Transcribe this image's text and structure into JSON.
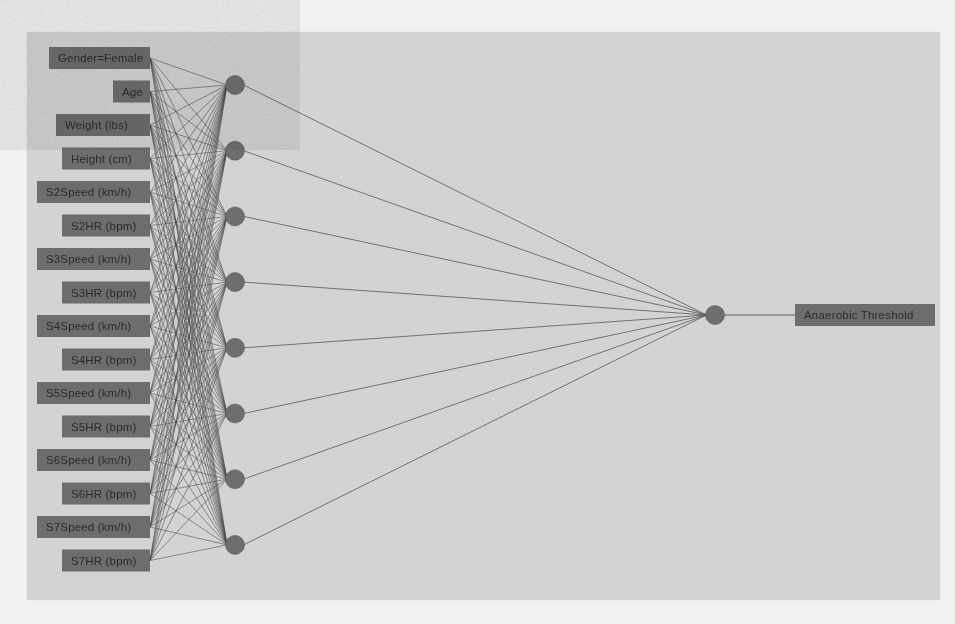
{
  "diagram": {
    "type": "multilayer-perceptron",
    "colors": {
      "outer_background": "#f1f1f1",
      "panel_background": "#d3d3d3",
      "node_fill": "#6e6e6e",
      "label_box_fill": "#6d6d6d",
      "label_text": "#2a2a2a",
      "edge": "#4a4a4a"
    },
    "layers": {
      "input": {
        "name": "input-layer",
        "count": 16,
        "nodes": [
          {
            "label": "Gender=Female"
          },
          {
            "label": "Age"
          },
          {
            "label": "Weight (lbs)"
          },
          {
            "label": "Height (cm)"
          },
          {
            "label": "S2Speed  (km/h)"
          },
          {
            "label": "S2HR  (bpm)"
          },
          {
            "label": "S3Speed  (km/h)"
          },
          {
            "label": "S3HR  (bpm)"
          },
          {
            "label": "S4Speed  (km/h)"
          },
          {
            "label": "S4HR  (bpm)"
          },
          {
            "label": "S5Speed  (km/h)"
          },
          {
            "label": "S5HR  (bpm)"
          },
          {
            "label": "S6Speed  (km/h)"
          },
          {
            "label": "S6HR  (bpm)"
          },
          {
            "label": "S7Speed  (km/h)"
          },
          {
            "label": "S7HR  (bpm)"
          }
        ]
      },
      "hidden": {
        "name": "hidden-layer",
        "count": 8
      },
      "output": {
        "name": "output-layer",
        "count": 1,
        "nodes": [
          {
            "label": "Anaerobic Threshold"
          }
        ]
      }
    }
  }
}
